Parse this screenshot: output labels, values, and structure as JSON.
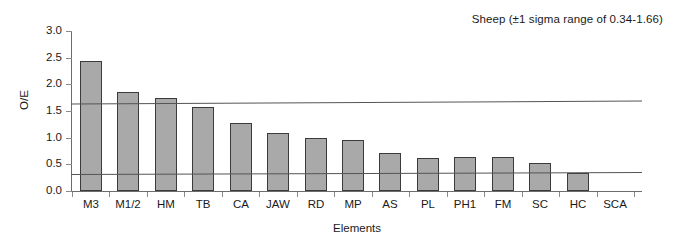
{
  "chart_data": {
    "type": "bar",
    "title": "Sheep (±1 sigma range of 0.34-1.66)",
    "xlabel": "Elements",
    "ylabel": "O/E",
    "ylim": [
      0.0,
      3.0
    ],
    "ytick_labels": [
      "3.0",
      "2.5",
      "2.0",
      "1.5",
      "1.0",
      "0.5",
      "0.0"
    ],
    "ytick_values": [
      3.0,
      2.5,
      2.0,
      1.5,
      1.0,
      0.5,
      0.0
    ],
    "grid": false,
    "legend": "none",
    "categories": [
      "M3",
      "M1/2",
      "HM",
      "TB",
      "CA",
      "JAW",
      "RD",
      "MP",
      "AS",
      "PL",
      "PH1",
      "FM",
      "SC",
      "HC",
      "SCA"
    ],
    "values": [
      2.43,
      1.85,
      1.75,
      1.57,
      1.28,
      1.09,
      1.0,
      0.95,
      0.72,
      0.62,
      0.63,
      0.63,
      0.53,
      0.34,
      0.0
    ],
    "series": [
      {
        "name": "O/E",
        "values": [
          2.43,
          1.85,
          1.75,
          1.57,
          1.28,
          1.09,
          1.0,
          0.95,
          0.72,
          0.62,
          0.63,
          0.63,
          0.53,
          0.34,
          0.0
        ]
      }
    ],
    "annotations": [
      {
        "name": "upper-sigma-line",
        "value": 1.66,
        "label": "+1 sigma"
      },
      {
        "name": "lower-sigma-line",
        "value": 0.34,
        "label": "-1 sigma"
      }
    ],
    "colors": {
      "bar_fill": "#a9a9a9",
      "bar_border": "#3b3b3b",
      "reference_line": "#555555",
      "axis": "#6d6d6d",
      "text": "#1a1a1a",
      "background": "#ffffff"
    }
  }
}
